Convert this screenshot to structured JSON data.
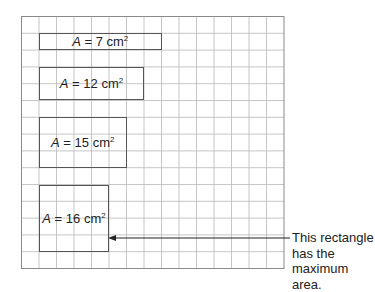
{
  "grid": {
    "columns": 15,
    "rows": 15,
    "left": 21.5,
    "top": 16.5,
    "cell_width": 17.5,
    "cell_height": 16.8,
    "line_color": "#b8b8b8",
    "border_color": "#8a8a8a"
  },
  "rectangles": [
    {
      "id": "a7",
      "col": 1,
      "row": 1,
      "width": 7,
      "height": 1,
      "var": "A",
      "eq": " = ",
      "value": "7",
      "unit": " cm",
      "exp": "2"
    },
    {
      "id": "a12",
      "col": 1,
      "row": 3,
      "width": 6,
      "height": 2,
      "var": "A",
      "eq": " = ",
      "value": "12",
      "unit": " cm",
      "exp": "2"
    },
    {
      "id": "a15",
      "col": 1,
      "row": 6,
      "width": 5,
      "height": 3,
      "var": "A",
      "eq": " = ",
      "value": "15",
      "unit": " cm",
      "exp": "2"
    },
    {
      "id": "a16",
      "col": 1,
      "row": 10,
      "width": 4,
      "height": 4,
      "var": "A",
      "eq": " = ",
      "value": "16",
      "unit": " cm",
      "exp": "2"
    }
  ],
  "callout": {
    "lines": [
      "This rectangle",
      "has the",
      "maximum area."
    ],
    "arrow": {
      "from_x": 290,
      "to_x": 108,
      "y": 238
    }
  }
}
